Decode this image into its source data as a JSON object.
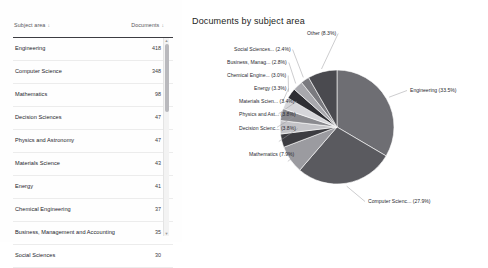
{
  "table": {
    "columns": [
      {
        "label": "Subject area",
        "sort_icon": "sort-down-icon",
        "sort_glyph": "↓"
      },
      {
        "label": "Documents",
        "sort_icon": "sort-down-icon",
        "sort_glyph": "↓"
      }
    ],
    "rows": [
      {
        "subject": "Engineering",
        "documents": "418"
      },
      {
        "subject": "Computer Science",
        "documents": "348"
      },
      {
        "subject": "Mathematics",
        "documents": "98"
      },
      {
        "subject": "Decision Sciences",
        "documents": "47"
      },
      {
        "subject": "Physics and Astronomy",
        "documents": "47"
      },
      {
        "subject": "Materials Science",
        "documents": "43"
      },
      {
        "subject": "Energy",
        "documents": "41"
      },
      {
        "subject": "Chemical Engineering",
        "documents": "37"
      },
      {
        "subject": "Business, Management and Accounting",
        "documents": "35"
      },
      {
        "subject": "Social Sciences",
        "documents": "30"
      }
    ],
    "scrollbar": {
      "up_glyph": "▲",
      "down_glyph": "▼"
    }
  },
  "chart": {
    "title": "Documents by subject area"
  },
  "chart_data": {
    "type": "pie",
    "title": "Documents by subject area",
    "legend": "none",
    "labels_position": "outside-with-leader-lines",
    "categories": [
      "Engineering",
      "Computer Scienc...",
      "Mathematics",
      "Decision Scienc...",
      "Physics and Ast...",
      "Materials Scien...",
      "Energy",
      "Chemical Engine...",
      "Business, Manag...",
      "Social Sciences...",
      "Other"
    ],
    "percentages": [
      33.5,
      27.9,
      7.9,
      3.8,
      3.8,
      3.4,
      3.3,
      3.0,
      2.8,
      2.4,
      8.3
    ],
    "data_labels": [
      "Engineering (33.5%)",
      "Computer Scienc... (27.9%)",
      "Mathematics (7.9%)",
      "Decision Scienc... (3.8%)",
      "Physics and Ast... (3.8%)",
      "Materials Scien... (3.4%)",
      "Energy (3.3%)",
      "Chemical Engine... (3.0%)",
      "Business, Manag... (2.8%)",
      "Social Sciences... (2.4%)",
      "Other (8.3%)"
    ],
    "colors": [
      "#6e6e73",
      "#5a5a5f",
      "#9b9ba0",
      "#3c3c41",
      "#c4c4c8",
      "#8b8b90",
      "#d6d6da",
      "#2e2e33",
      "#a8a8ad",
      "#7a7a7f",
      "#4a4a4f"
    ]
  }
}
